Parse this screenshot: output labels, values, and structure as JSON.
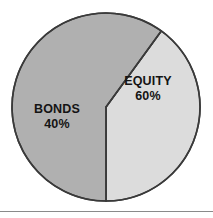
{
  "chart_data": {
    "type": "pie",
    "title": "",
    "subtitle": "",
    "xlabel": "",
    "ylabel": "",
    "legend_position": "none",
    "grid": false,
    "labels_on_slices": true,
    "categories": [
      "EQUITY",
      "BONDS"
    ],
    "values": [
      60,
      40
    ],
    "units": "%",
    "slices": [
      {
        "name": "EQUITY",
        "value": 60,
        "value_text": "60%",
        "color": "#b0b0b0",
        "start_angle_deg": 216,
        "end_angle_deg": 360
      },
      {
        "name": "BONDS",
        "value": 40,
        "value_text": "40%",
        "color": "#dcdcdc",
        "start_angle_deg": 0,
        "end_angle_deg": 216
      }
    ]
  },
  "figure": {
    "background_color": "#ffffff",
    "outline_color": "#3a3a3a",
    "label_color": "#141414",
    "rule_color": "#8a8a8a",
    "center_x": 106,
    "center_y": 107,
    "radius": 94
  }
}
